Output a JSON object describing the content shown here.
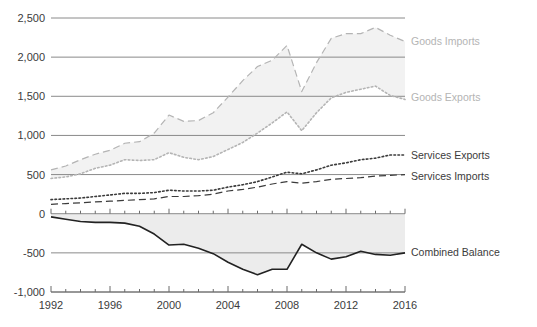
{
  "chart_data": {
    "type": "line",
    "title": "",
    "subtitle": "",
    "xlabel": "",
    "ylabel": "",
    "xlim": [
      1992,
      2016
    ],
    "ylim": [
      -1000,
      2500
    ],
    "grid": true,
    "legend_position": "right-inline",
    "x_tick_labels": [
      "1992",
      "1996",
      "2000",
      "2004",
      "2008",
      "2012",
      "2016"
    ],
    "x_tick_values": [
      1992,
      1996,
      2000,
      2004,
      2008,
      2012,
      2016
    ],
    "x_minor_tick_interval": 1,
    "y_tick_labels": [
      "2,500",
      "2,000",
      "1,500",
      "1,000",
      "500",
      "0",
      "-500",
      "-1,000"
    ],
    "y_tick_values": [
      2500,
      2000,
      1500,
      1000,
      500,
      0,
      -500,
      -1000
    ],
    "x": [
      1992,
      1993,
      1994,
      1995,
      1996,
      1997,
      1998,
      1999,
      2000,
      2001,
      2002,
      2003,
      2004,
      2005,
      2006,
      2007,
      2008,
      2009,
      2010,
      2011,
      2012,
      2013,
      2014,
      2015,
      2016
    ],
    "series": [
      {
        "name": "Goods Imports",
        "style": "dashed",
        "color": "#b4b4b4",
        "values": [
          560,
          610,
          690,
          760,
          810,
          900,
          920,
          1030,
          1260,
          1180,
          1190,
          1290,
          1490,
          1700,
          1880,
          1960,
          2150,
          1560,
          1930,
          2240,
          2300,
          2300,
          2380,
          2280,
          2200
        ]
      },
      {
        "name": "Goods Exports",
        "style": "dotted",
        "color": "#b4b4b4",
        "values": [
          450,
          470,
          510,
          580,
          620,
          690,
          680,
          690,
          780,
          720,
          690,
          730,
          820,
          910,
          1030,
          1160,
          1300,
          1060,
          1290,
          1480,
          1550,
          1590,
          1630,
          1510,
          1460
        ]
      },
      {
        "name": "Services Exports",
        "style": "dotted",
        "color": "#3b3b3b",
        "values": [
          180,
          190,
          200,
          220,
          240,
          260,
          260,
          270,
          300,
          290,
          290,
          300,
          340,
          370,
          410,
          470,
          530,
          510,
          560,
          620,
          650,
          690,
          710,
          750,
          750
        ]
      },
      {
        "name": "Services Imports",
        "style": "dashed",
        "color": "#3b3b3b",
        "values": [
          120,
          130,
          140,
          150,
          160,
          170,
          180,
          190,
          220,
          220,
          230,
          250,
          290,
          310,
          340,
          380,
          410,
          390,
          410,
          440,
          450,
          460,
          480,
          490,
          500
        ]
      },
      {
        "name": "Combined Balance",
        "style": "solid",
        "color": "#222222",
        "values": [
          -40,
          -70,
          -100,
          -110,
          -110,
          -120,
          -160,
          -260,
          -400,
          -390,
          -440,
          -510,
          -620,
          -710,
          -780,
          -710,
          -710,
          -390,
          -500,
          -580,
          -550,
          -480,
          -520,
          -530,
          -500
        ]
      }
    ],
    "shaded_bands": [
      {
        "between": [
          "Goods Imports",
          "Goods Exports"
        ],
        "fill": "#f2f2f2"
      },
      {
        "between": [
          "Combined Balance",
          "zero"
        ],
        "fill": "#ececec"
      }
    ]
  },
  "legend": {
    "items": [
      {
        "label": "Goods Imports"
      },
      {
        "label": "Goods Exports"
      },
      {
        "label": "Services Exports"
      },
      {
        "label": "Services Imports"
      },
      {
        "label": "Combined Balance"
      }
    ]
  }
}
